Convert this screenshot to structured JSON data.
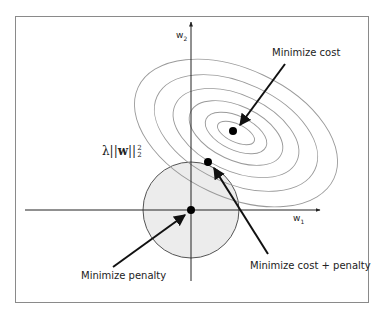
{
  "figure": {
    "labels": {
      "minimize_cost": "Minimize cost",
      "minimize_penalty": "Minimize penalty",
      "minimize_cost_penalty": "Minimize cost + penalty"
    },
    "axes": {
      "x_label": "w",
      "x_sub": "1",
      "y_label": "w",
      "y_sub": "2"
    },
    "penalty_term": {
      "lambda": "λ",
      "norm_open": "||",
      "vector": "w",
      "norm_close": "||",
      "superscript": "2",
      "subscript": "2"
    },
    "colors": {
      "frame": "#8a8a8a",
      "axis": "#222222",
      "contour": "#9a9a9a",
      "penalty_fill": "#ececec",
      "penalty_stroke": "#555555",
      "points": "#000000",
      "arrows": "#111111"
    },
    "points": [
      {
        "name": "cost-minimum",
        "x": 233,
        "y": 131
      },
      {
        "name": "regularized-minimum",
        "x": 208,
        "y": 162
      },
      {
        "name": "origin-penalty-minimum",
        "x": 191,
        "y": 210
      }
    ]
  }
}
